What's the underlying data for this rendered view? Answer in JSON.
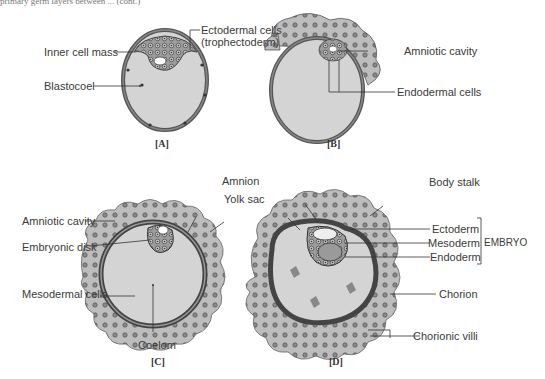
{
  "header": {
    "cropped_text": "primary germ layers between ... (cont.)"
  },
  "figures": {
    "A": {
      "caption": "[A]",
      "labels": {
        "inner_cell_mass": "Inner cell mass",
        "blastocoel": "Blastocoel",
        "ectodermal_cells": "Ectodermal cells",
        "trophectoderm": "(trophectoderm)"
      }
    },
    "B": {
      "caption": "[B]",
      "labels": {
        "amniotic_cavity": "Amniotic cavity",
        "endodermal_cells": "Endodermal cells"
      }
    },
    "C": {
      "caption": "[C]",
      "labels": {
        "amniotic_cavity": "Amniotic cavity",
        "embryonic_disk": "Embryonic disk",
        "mesodermal_cells": "Mesodermal cells",
        "coelom": "Coelom",
        "amnion": "Amnion",
        "yolk_sac": "Yolk sac"
      }
    },
    "D": {
      "caption": "[D]",
      "labels": {
        "body_stalk": "Body stalk",
        "ectoderm": "Ectoderm",
        "mesoderm": "Mesoderm",
        "endoderm": "Endoderm",
        "embryo": "EMBRYO",
        "chorion": "Chorion",
        "chorionic_villi": "Chorionic villi"
      }
    }
  },
  "colors": {
    "cavity_fill": "#d4d4d4",
    "villi_fill": "#b8b8b8",
    "cell_dark": "#4a4a4a",
    "yolk_fill": "#9a9a9a",
    "line": "#333333"
  }
}
